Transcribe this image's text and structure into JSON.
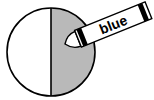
{
  "diagram": {
    "circle": {
      "parts": 2,
      "shaded_parts": 1,
      "shaded_side": "right"
    },
    "crayon": {
      "label": "blue"
    },
    "colors": {
      "shade": "#b9b9b9",
      "outline": "#000000",
      "background": "#ffffff"
    }
  }
}
